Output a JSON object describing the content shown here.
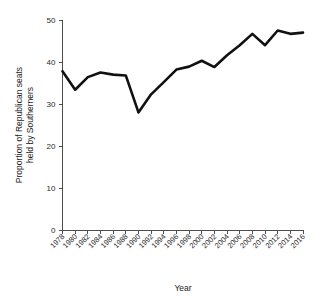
{
  "chart_data": {
    "type": "line",
    "title": "",
    "xlabel": "Year",
    "ylabel": "Proportion of Republican seats held by Southerners",
    "ylabel_line1": "Proportion of Republican seats",
    "ylabel_line2": "held by Southerners",
    "xlim": [
      1978,
      2016
    ],
    "ylim": [
      0,
      50
    ],
    "yticks": [
      0,
      10,
      20,
      30,
      40,
      50
    ],
    "ytick_labels": [
      "0",
      "10",
      "20",
      "30",
      "40",
      "50"
    ],
    "grid": false,
    "legend": false,
    "line_color": "#111111",
    "categories": [
      1978,
      1980,
      1982,
      1984,
      1986,
      1988,
      1990,
      1992,
      1994,
      1996,
      1998,
      2000,
      2002,
      2004,
      2006,
      2008,
      2010,
      2012,
      2014,
      2016
    ],
    "xtick_labels": [
      "1978",
      "1980",
      "1982",
      "1984",
      "1986",
      "1988",
      "1990",
      "1992",
      "1994",
      "1996",
      "1998",
      "2000",
      "2002",
      "2004",
      "2006",
      "2008",
      "2010",
      "2012",
      "2014",
      "2016"
    ],
    "values": [
      37.8,
      33.4,
      36.4,
      37.5,
      37.0,
      36.8,
      28.0,
      32.3,
      35.2,
      38.2,
      38.9,
      40.3,
      38.8,
      41.6,
      44.0,
      46.7,
      44.0,
      47.5,
      46.7,
      47.0
    ]
  }
}
